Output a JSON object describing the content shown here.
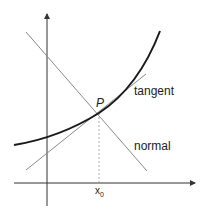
{
  "diagram": {
    "title": "",
    "labels": {
      "point": "P",
      "tangent": "tangent",
      "normal": "normal",
      "x0_base": "x",
      "x0_sub": "0"
    },
    "colors": {
      "curve": "#1a1a1a",
      "axes": "#333333",
      "lines": "#8a8a8a",
      "dashed": "#9a9a9a",
      "text": "#222222"
    },
    "elements": [
      "y-axis",
      "x-axis",
      "curve",
      "tangent-line",
      "normal-line",
      "dashed-drop-line",
      "point-P"
    ]
  }
}
